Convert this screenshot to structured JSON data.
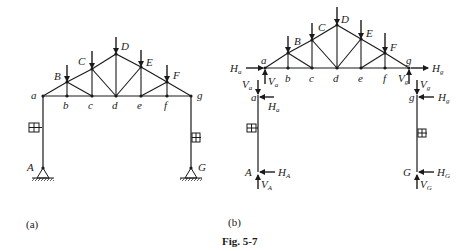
{
  "figure": {
    "caption": "Fig. 5-7",
    "panels": [
      {
        "id": "a",
        "label": "(a)",
        "joint_labels": {
          "bottom": [
            "a",
            "b",
            "c",
            "d",
            "e",
            "f",
            "g"
          ],
          "top": [
            "B",
            "C",
            "D",
            "E",
            "F"
          ],
          "supports": [
            "A",
            "G"
          ]
        }
      },
      {
        "id": "b",
        "label": "(b)",
        "joint_labels": {
          "bottom": [
            "a",
            "b",
            "c",
            "d",
            "e",
            "f",
            "g"
          ],
          "top": [
            "B",
            "C",
            "D",
            "E",
            "F"
          ],
          "column_tops": [
            "a",
            "g"
          ],
          "supports": [
            "A",
            "G"
          ]
        },
        "forces": {
          "truss_left_h": {
            "sym": "H",
            "sub": "a"
          },
          "truss_left_v": {
            "sym": "V",
            "sub": "a"
          },
          "truss_right_h": {
            "sym": "H",
            "sub": "g"
          },
          "truss_right_v": {
            "sym": "V",
            "sub": "g"
          },
          "col_left_top_v": {
            "sym": "V",
            "sub": "a"
          },
          "col_left_top_h": {
            "sym": "H",
            "sub": "a"
          },
          "col_right_top_v": {
            "sym": "V",
            "sub": "g"
          },
          "col_right_top_h": {
            "sym": "H",
            "sub": "g"
          },
          "base_left_h": {
            "sym": "H",
            "sub": "A"
          },
          "base_left_v": {
            "sym": "V",
            "sub": "A"
          },
          "base_right_h": {
            "sym": "H",
            "sub": "G"
          },
          "base_right_v": {
            "sym": "V",
            "sub": "G"
          }
        }
      }
    ]
  }
}
